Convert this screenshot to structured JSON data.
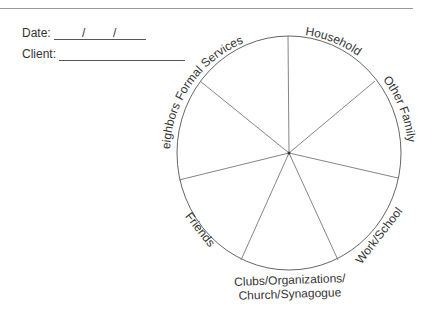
{
  "form": {
    "date_label": "Date:",
    "date_sep1": "/",
    "date_sep2": "/",
    "client_label": "Client:"
  },
  "diagram": {
    "type": "social-support-wheel",
    "segments": [
      {
        "label": "Household"
      },
      {
        "label": "Other Family"
      },
      {
        "label": "Work/School"
      },
      {
        "label_line1": "Clubs/Organizations/",
        "label_line2": "Church/Synagogue"
      },
      {
        "label": "Friends"
      },
      {
        "label": "Neighbors"
      },
      {
        "label": "Formal Services"
      }
    ]
  }
}
